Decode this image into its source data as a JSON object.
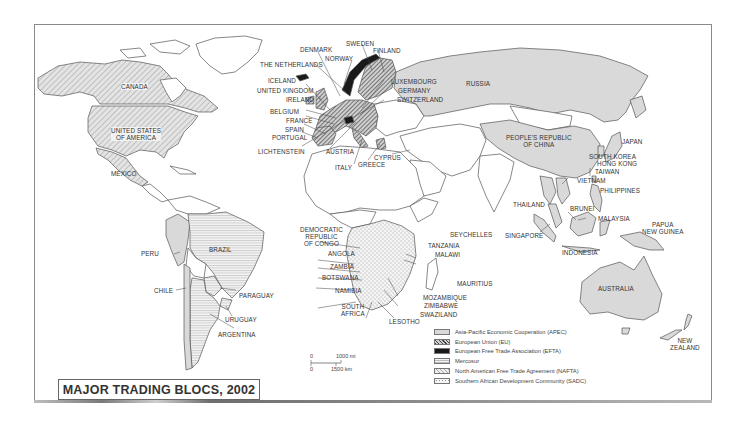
{
  "title": "MAJOR TRADING BLOCS, 2002",
  "legend": [
    {
      "key": "apec",
      "label": "Asia-Pacific Economic Cooperation (APEC)",
      "pattern": "light-gray-fill",
      "color": "#d9d9d9"
    },
    {
      "key": "eu",
      "label": "European Union (EU)",
      "pattern": "dense-diagonal-hatch",
      "color": "#555555"
    },
    {
      "key": "efta",
      "label": "European Free Trade Association (EFTA)",
      "pattern": "solid-black",
      "color": "#1a1a1a"
    },
    {
      "key": "mercosur",
      "label": "Mercosur",
      "pattern": "horizontal-lines",
      "color": "#bbbbbb"
    },
    {
      "key": "nafta",
      "label": "North American Free Trade Agreement (NAFTA)",
      "pattern": "light-diagonal-hatch",
      "color": "#cccccc"
    },
    {
      "key": "sadc",
      "label": "Southern African Development Community (SADC)",
      "pattern": "dotted",
      "color": "#999999"
    }
  ],
  "scale": {
    "zero_top": "0",
    "mi_label": "1000 mi",
    "zero_bottom": "0",
    "km_label": "1500 km"
  },
  "labels": {
    "canada": "CANADA",
    "usa_1": "UNITED STATES",
    "usa_2": "OF AMERICA",
    "mexico": "MEXICO",
    "peru": "PERU",
    "brazil": "BRAZIL",
    "chile": "CHILE",
    "paraguay": "PARAGUAY",
    "uruguay": "URUGUAY",
    "argentina": "ARGENTINA",
    "denmark": "DENMARK",
    "sweden": "SWEDEN",
    "finland": "FINLAND",
    "norway": "NORWAY",
    "netherlands": "THE NETHERLANDS",
    "iceland": "ICELAND",
    "uk": "UNITED KINGDOM",
    "ireland": "IRELAND",
    "belgium": "BELGIUM",
    "france": "FRANCE",
    "spain": "SPAIN",
    "portugal": "PORTUGAL",
    "liechtenstein": "LICHTENSTEIN",
    "austria": "AUSTRIA",
    "italy": "ITALY",
    "greece": "GREECE",
    "cyprus": "CYPRUS",
    "luxembourg": "LUXEMBOURG",
    "germany": "GERMANY",
    "switzerland": "SWITZERLAND",
    "russia": "RUSSIA",
    "china_1": "PEOPLE'S REPUBLIC",
    "china_2": "OF CHINA",
    "japan": "JAPAN",
    "south_korea": "SOUTH KOREA",
    "hong_kong": "HONG KONG",
    "taiwan": "TAIWAN",
    "vietnam": "VIETNAM",
    "philippines": "PHILIPPINES",
    "thailand": "THAILAND",
    "brunei": "BRUNEI",
    "malaysia": "MALAYSIA",
    "singapore": "SINGAPORE",
    "indonesia": "INDONESIA",
    "png_1": "PAPUA",
    "png_2": "NEW GUINEA",
    "australia": "AUSTRALIA",
    "nz_1": "NEW",
    "nz_2": "ZEALAND",
    "drc_1": "DEMOCRATIC",
    "drc_2": "REPUBLIC",
    "drc_3": "OF CONGO",
    "angola": "ANGOLA",
    "zambia": "ZAMBIA",
    "botswana": "BOTSWANA",
    "namibia": "NAMIBIA",
    "south_africa_1": "SOUTH",
    "south_africa_2": "AFRICA",
    "lesotho": "LESOTHO",
    "swaziland": "SWAZILAND",
    "zimbabwe": "ZIMBABWE",
    "mozambique": "MOZAMBIQUE",
    "malawi": "MALAWI",
    "tanzania": "TANZANIA",
    "seychelles": "SEYCHELLES",
    "mauritius": "MAURITIUS"
  }
}
